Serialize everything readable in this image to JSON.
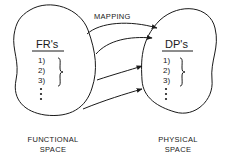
{
  "diagram": {
    "mapping_label": "MAPPING",
    "functional": {
      "header": "FR's",
      "items": [
        "1)",
        "2)",
        "3)"
      ],
      "caption_line1": "FUNCTIONAL",
      "caption_line2": "SPACE"
    },
    "physical": {
      "header": "DP's",
      "items": [
        "1)",
        "2)",
        "3)"
      ],
      "caption_line1": "PHYSICAL",
      "caption_line2": "SPACE"
    },
    "arrow_count": 4,
    "line_color": "#1a1a1a"
  }
}
